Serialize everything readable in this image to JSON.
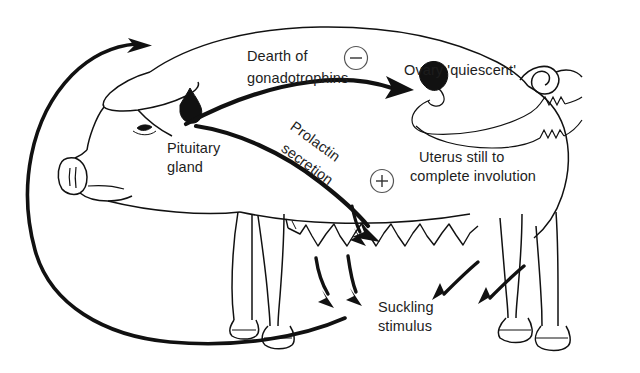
{
  "diagram": {
    "labels": {
      "dearth_line1": "Dearth of",
      "dearth_line2": "gonadotrophins",
      "ovary": "Ovary 'quiescent'",
      "pituitary_line1": "Pituitary",
      "pituitary_line2": "gland",
      "uterus_line1": "Uterus still to",
      "uterus_line2": "complete involution",
      "prolactin_line1": "Prolactin",
      "prolactin_line2": "secretion",
      "suckling_line1": "Suckling",
      "suckling_line2": "stimulus"
    },
    "signs": {
      "negative": "–",
      "positive": "+"
    },
    "colors": {
      "ink": "#111111",
      "background": "#ffffff",
      "organ_fill": "#111111"
    }
  }
}
